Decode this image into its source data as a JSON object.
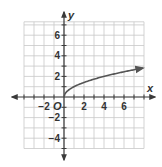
{
  "chart_data": {
    "type": "line",
    "title": "",
    "xlabel": "x",
    "ylabel": "y",
    "origin_label": "O",
    "xlim": [
      -4,
      8
    ],
    "ylim": [
      -5,
      7.3
    ],
    "grid": true,
    "grid_step": 1,
    "x_ticks": [
      -2,
      2,
      4,
      6
    ],
    "y_ticks": [
      6,
      4,
      2,
      -2,
      -4
    ],
    "x_tick_labels": [
      "−2",
      "2",
      "4",
      "6"
    ],
    "y_tick_labels": [
      "6",
      "4",
      "2",
      "−2",
      "−4"
    ],
    "series": [
      {
        "name": "y = √x",
        "function": "sqrt(x)",
        "x": [
          0,
          0.25,
          0.5,
          1,
          2,
          3,
          4,
          5,
          6,
          7,
          8
        ],
        "y": [
          0,
          0.5,
          0.71,
          1,
          1.41,
          1.73,
          2,
          2.24,
          2.45,
          2.65,
          2.83
        ],
        "endpoint_arrow": true,
        "color": "#555555"
      }
    ]
  }
}
